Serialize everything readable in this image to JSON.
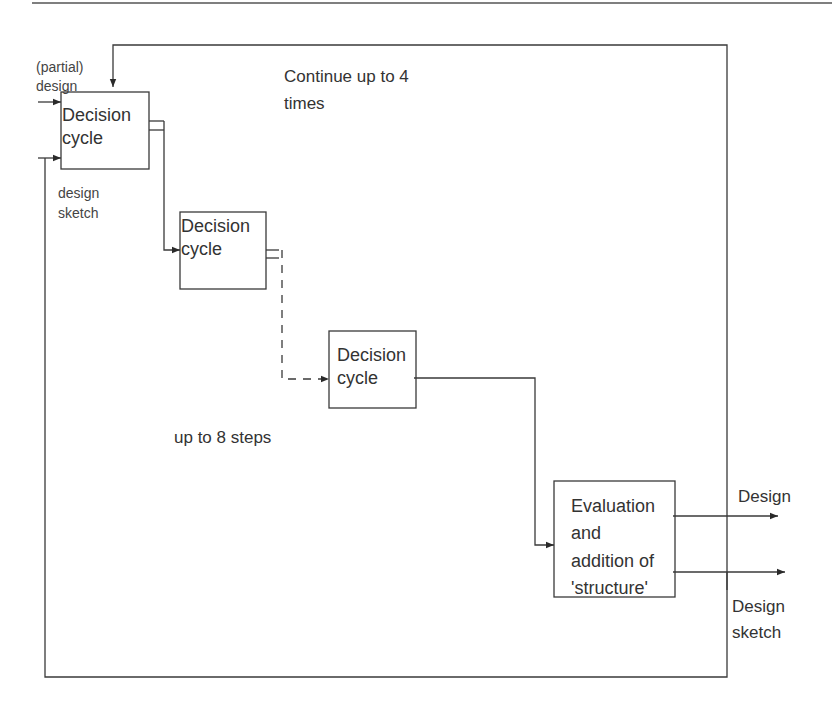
{
  "diagram": {
    "nodes": {
      "cycle1": {
        "label": "Decision\ncycle"
      },
      "cycle2": {
        "label": "Decision\ncycle"
      },
      "cycle3": {
        "label": "Decision\ncycle"
      },
      "evaluation": {
        "label": "Evaluation\nand\naddition of\n'structure'"
      }
    },
    "labels": {
      "input_partial_design": "(partial)\ndesign",
      "input_design_sketch": "design\nsketch",
      "loop_note": "Continue up to 4\ntimes",
      "steps_note": "up to 8 steps",
      "output_design": "Design",
      "output_design_sketch": "Design\nsketch"
    },
    "colors": {
      "line": "#3a3a3a",
      "text": "#333333",
      "background": "#ffffff"
    }
  }
}
